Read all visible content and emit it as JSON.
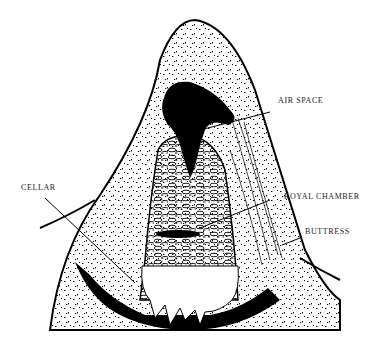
{
  "diagram": {
    "labels": {
      "air_space": "AIR SPACE",
      "royal_chamber": "ROYAL CHAMBER",
      "buttress": "BUTTRESS",
      "cellar": "CELLAR"
    },
    "colors": {
      "ink": "#000000",
      "background": "#ffffff"
    }
  }
}
